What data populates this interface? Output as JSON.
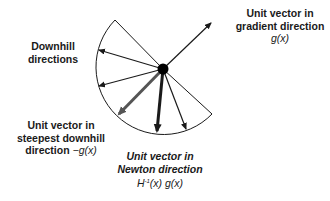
{
  "diagram": {
    "type": "vector-directions",
    "center": [
      163,
      69
    ],
    "colors": {
      "line": "#1a1a1a",
      "steepest_arrow": "#555555",
      "background": "#ffffff"
    },
    "labels": {
      "gradient": {
        "line1": "Unit vector in",
        "line2": "gradient direction",
        "formula": "g(x)"
      },
      "downhill": {
        "line1": "Downhill",
        "line2": "directions"
      },
      "steepest": {
        "line1": "Unit vector in",
        "line2": "steepest downhill",
        "line3_text": "direction ",
        "line3_formula": "−g(x)"
      },
      "newton": {
        "line1": "Unit vector in",
        "line2": "Newton direction",
        "formula_H": "H",
        "formula_sup": "-1",
        "formula_rest": "(x) g(x)"
      }
    },
    "arrows": [
      {
        "name": "gradient",
        "tip": [
          212,
          22
        ]
      },
      {
        "name": "downhill-1",
        "tip": [
          98,
          50
        ]
      },
      {
        "name": "downhill-2",
        "tip": [
          98,
          86
        ]
      },
      {
        "name": "steepest-downhill",
        "tip": [
          117,
          116
        ]
      },
      {
        "name": "newton",
        "tip": [
          157,
          133
        ]
      },
      {
        "name": "downhill-3",
        "tip": [
          187,
          130
        ]
      }
    ]
  }
}
